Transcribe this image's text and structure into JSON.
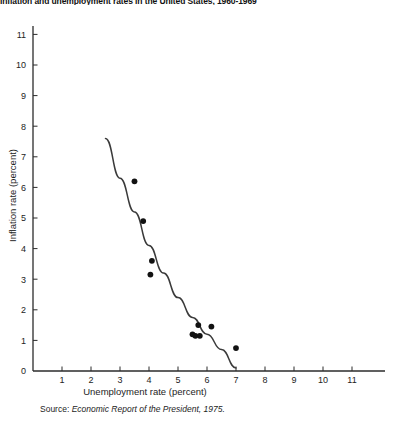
{
  "title": "Inflation and unemployment rates in the United States, 1960-1969",
  "source": {
    "label": "Source:",
    "text": "Economic Report of the President, 1975."
  },
  "chart_data": {
    "type": "scatter",
    "title": "Inflation and unemployment rates in the United States, 1960-1969",
    "xlabel": "Unemployment rate (percent)",
    "ylabel": "Inflation rate (percent)",
    "xlim": [
      0,
      11.5
    ],
    "ylim": [
      0,
      11.5
    ],
    "xticks": [
      1,
      2,
      3,
      4,
      5,
      6,
      7,
      8,
      9,
      10,
      11
    ],
    "yticks": [
      0,
      1,
      2,
      3,
      4,
      5,
      6,
      7,
      8,
      9,
      10,
      11
    ],
    "grid": false,
    "legend": null,
    "marker_color": "#121212",
    "curve_color": "#3a3a3a",
    "axis_color": "#2b2b2b",
    "points": [
      {
        "x": 3.5,
        "y": 6.2
      },
      {
        "x": 3.8,
        "y": 4.9
      },
      {
        "x": 4.1,
        "y": 3.6
      },
      {
        "x": 4.05,
        "y": 3.15
      },
      {
        "x": 5.5,
        "y": 1.2
      },
      {
        "x": 5.6,
        "y": 1.15
      },
      {
        "x": 5.7,
        "y": 1.5
      },
      {
        "x": 5.75,
        "y": 1.15
      },
      {
        "x": 6.15,
        "y": 1.45
      },
      {
        "x": 7.0,
        "y": 0.75
      }
    ],
    "fit_curve": {
      "name": "Phillips curve",
      "points": [
        {
          "x": 2.5,
          "y": 7.6
        },
        {
          "x": 3.0,
          "y": 6.3
        },
        {
          "x": 3.5,
          "y": 5.2
        },
        {
          "x": 4.0,
          "y": 4.1
        },
        {
          "x": 4.5,
          "y": 3.2
        },
        {
          "x": 5.0,
          "y": 2.4
        },
        {
          "x": 5.5,
          "y": 1.75
        },
        {
          "x": 6.0,
          "y": 1.2
        },
        {
          "x": 6.5,
          "y": 0.7
        },
        {
          "x": 7.0,
          "y": 0.1
        }
      ]
    }
  }
}
